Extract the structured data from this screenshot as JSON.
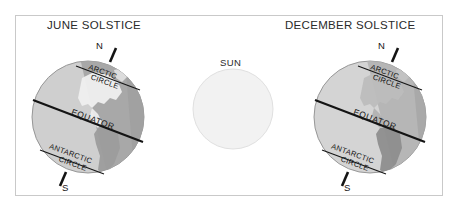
{
  "diagram": {
    "title_left": "JUNE SOLSTICE",
    "title_right": "DECEMBER SOLSTICE",
    "sun_label": "SUN",
    "colors": {
      "frame_border": "#c9c9c9",
      "background": "#ffffff",
      "globe_lit": "#cfcfcf",
      "globe_dark": "#9a9a9a",
      "globe_outline": "#8a8a8a",
      "land_lit": "#f0f0f0",
      "land_dark": "#8a8a8a",
      "line": "#141414",
      "sun_fill": "#f2f2f2",
      "sun_outline": "#e2e2e2",
      "text": "#2a2a2a"
    },
    "globes": [
      {
        "id": "june-solstice-earth",
        "season": "JUNE SOLSTICE",
        "north_pole_label": "N",
        "south_pole_label": "S",
        "lines": [
          {
            "name": "arctic-circle",
            "label": "ARCTIC CIRCLE"
          },
          {
            "name": "equator",
            "label": "EQUATOR"
          },
          {
            "name": "antarctic-circle",
            "label": "ANTARCTIC CIRCLE"
          }
        ],
        "axis_tilt_degrees": 23.5,
        "illuminated_hemisphere": "Northern",
        "shadow_side": "upper-right"
      },
      {
        "id": "december-solstice-earth",
        "season": "DECEMBER SOLSTICE",
        "north_pole_label": "N",
        "south_pole_label": "S",
        "lines": [
          {
            "name": "arctic-circle",
            "label": "ARCTIC CIRCLE"
          },
          {
            "name": "equator",
            "label": "EQUATOR"
          },
          {
            "name": "antarctic-circle",
            "label": "ANTARCTIC CIRCLE"
          }
        ],
        "axis_tilt_degrees": 23.5,
        "illuminated_hemisphere": "Southern",
        "shadow_side": "lower-right"
      }
    ],
    "sun": {
      "label": "SUN",
      "position": "center"
    }
  }
}
